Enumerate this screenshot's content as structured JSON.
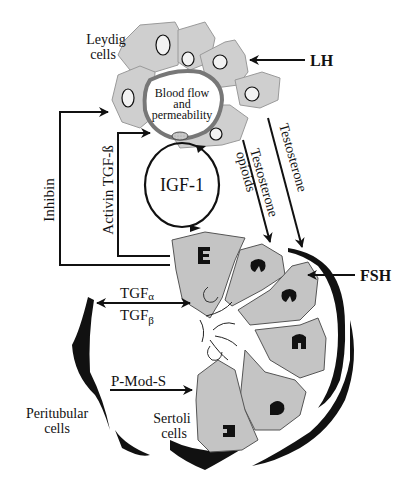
{
  "diagram": {
    "leydig_label_line1": "Leydig",
    "leydig_label_line2": "cells",
    "vessel_label_line1": "Blood flow",
    "vessel_label_line2": "and",
    "vessel_label_line3": "permeability",
    "lh_label": "LH",
    "fsh_label": "FSH",
    "testosterone_label": "Testosterone",
    "testosterone_opioids_line1": "Testosterone",
    "testosterone_opioids_line2": "opioids",
    "inhibin_label": "Inhibin",
    "activin_label": "Activin TGF-ß",
    "igf_label": "IGF-1",
    "tgf_alpha_main": "TGF",
    "tgf_alpha_sub": "α",
    "tgf_beta_main": "TGF",
    "tgf_beta_sub": "β",
    "pmods_label": "P-Mod-S",
    "peritubular_line1": "Peritubular",
    "peritubular_line2": "cells",
    "sertoli_line1": "Sertoli",
    "sertoli_line2": "cells"
  }
}
